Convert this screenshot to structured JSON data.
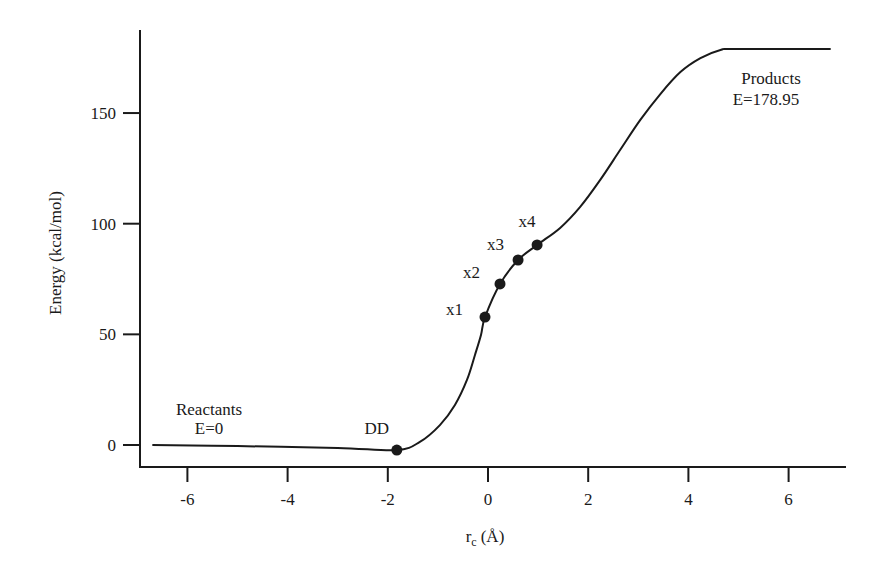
{
  "chart_data": {
    "type": "line",
    "title": "",
    "xlabel": "r_c (Å)",
    "xlabel_main": "r",
    "xlabel_sub": "c",
    "xlabel_unit": "(Å)",
    "ylabel": "Energy (kcal/mol)",
    "xlim": [
      -6.8,
      7.1
    ],
    "ylim": [
      -10,
      186
    ],
    "x_ticks": [
      -6,
      -4,
      -2,
      0,
      2,
      4,
      6
    ],
    "x_tick_labels": [
      "-6",
      "-4",
      "-2",
      "0",
      "2",
      "4",
      "6"
    ],
    "y_ticks": [
      0,
      50,
      100,
      150
    ],
    "y_tick_labels": [
      "0",
      "50",
      "100",
      "150"
    ],
    "grid": false,
    "legend": null,
    "series": [
      {
        "name": "Energy profile",
        "x": [
          -6.7,
          -5.0,
          -3.0,
          -1.82,
          -1.36,
          -0.96,
          -0.66,
          -0.42,
          -0.26,
          -0.14,
          -0.06,
          0.24,
          0.6,
          0.98,
          1.44,
          1.84,
          2.24,
          2.64,
          3.04,
          3.44,
          3.84,
          4.24,
          4.64,
          4.94,
          6.84
        ],
        "y": [
          0,
          -0.5,
          -1.3,
          -2.3,
          1.4,
          9.0,
          18.1,
          29.4,
          40.7,
          49.7,
          57.8,
          72.8,
          83.6,
          90.4,
          98.1,
          107.6,
          119.8,
          133.4,
          146.9,
          158.6,
          168.5,
          174.8,
          178.5,
          178.95,
          178.95
        ]
      }
    ],
    "marked_points": [
      {
        "label": "DD",
        "x": -1.82,
        "y": -2.3
      },
      {
        "label": "x1",
        "x": -0.06,
        "y": 57.8
      },
      {
        "label": "x2",
        "x": 0.24,
        "y": 72.8
      },
      {
        "label": "x3",
        "x": 0.6,
        "y": 83.6
      },
      {
        "label": "x4",
        "x": 0.98,
        "y": 90.4
      }
    ],
    "annotations": [
      {
        "text": "Reactants",
        "line2": "E=0",
        "x": -5.3,
        "y": 10
      },
      {
        "text": "Products",
        "line2": "E=178.95",
        "x": 5.5,
        "y": 160
      }
    ]
  }
}
